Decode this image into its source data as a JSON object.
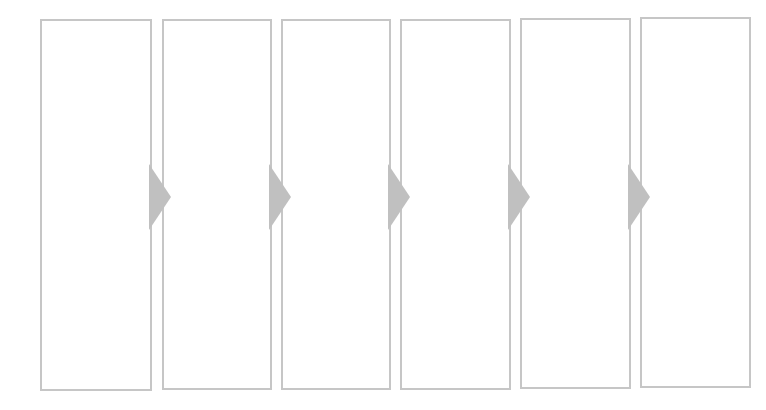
{
  "diagram": {
    "type": "process-flow",
    "direction": "left-to-right",
    "colors": {
      "border": "#c6c6c6",
      "arrow": "#c0c0c0",
      "background": "#ffffff"
    },
    "steps": [
      {
        "label": "",
        "x": 40,
        "y": 19,
        "w": 112,
        "h": 372
      },
      {
        "label": "",
        "x": 162,
        "y": 19,
        "w": 110,
        "h": 371
      },
      {
        "label": "",
        "x": 281,
        "y": 19,
        "w": 110,
        "h": 371
      },
      {
        "label": "",
        "x": 400,
        "y": 19,
        "w": 111,
        "h": 371
      },
      {
        "label": "",
        "x": 520,
        "y": 18,
        "w": 111,
        "h": 371
      },
      {
        "label": "",
        "x": 640,
        "y": 17,
        "w": 111,
        "h": 371
      }
    ],
    "connectors": [
      {
        "x": 149,
        "y": 164
      },
      {
        "x": 269,
        "y": 164
      },
      {
        "x": 388,
        "y": 164
      },
      {
        "x": 508,
        "y": 164
      },
      {
        "x": 628,
        "y": 164
      }
    ]
  }
}
